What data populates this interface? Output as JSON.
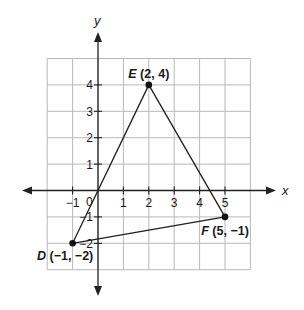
{
  "chart_data": {
    "type": "scatter",
    "title": "",
    "xlabel": "x",
    "ylabel": "y",
    "xlim": [
      -2,
      6
    ],
    "ylim": [
      -3,
      5
    ],
    "grid": true,
    "x_ticks": [
      -1,
      1,
      2,
      3,
      4,
      5
    ],
    "x_tick_labels": [
      "−1",
      "1",
      "2",
      "3",
      "4",
      "5"
    ],
    "y_ticks": [
      -2,
      -1,
      1,
      2,
      3,
      4
    ],
    "y_tick_labels": [
      "−2",
      "−1",
      "1",
      "2",
      "3",
      "4"
    ],
    "origin_label": "0",
    "points": [
      {
        "name": "E",
        "x": 2,
        "y": 4,
        "label": "E (2, 4)",
        "coords": "(2, 4)"
      },
      {
        "name": "F",
        "x": 5,
        "y": -1,
        "label": "F (5, −1)",
        "coords": "(5, −1)"
      },
      {
        "name": "D",
        "x": -1,
        "y": -2,
        "label": "D (−1, −2)",
        "coords": "(−1, −2)"
      }
    ],
    "segments": [
      {
        "from": "D",
        "to": "E"
      },
      {
        "from": "E",
        "to": "F"
      },
      {
        "from": "F",
        "to": "D"
      }
    ],
    "extra_segments": [
      {
        "from": [
          -1,
          -2
        ],
        "to": [
          2,
          4
        ],
        "note": "side DE passes through origin"
      }
    ],
    "shape": "triangle DEF"
  },
  "colors": {
    "grid": "#b8b8b8",
    "axis": "#222222",
    "line": "#1f1f1f",
    "point": "#111111",
    "background": "#ffffff"
  }
}
